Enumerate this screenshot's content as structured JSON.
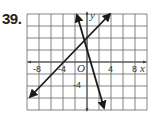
{
  "problem_number": "39.",
  "chart_data": {
    "type": "line",
    "title": "",
    "xlabel": "x",
    "ylabel": "y",
    "origin_label": "O",
    "xlim": [
      -10,
      10
    ],
    "ylim": [
      -8,
      8
    ],
    "grid": true,
    "grid_step": 2,
    "x_tick_labels": [
      "-8",
      "-4",
      "4",
      "8"
    ],
    "y_tick_labels": [
      "-4"
    ],
    "series": [
      {
        "name": "line-rising",
        "points": [
          [
            -9.5,
            -5.8
          ],
          [
            3.8,
            8
          ]
        ],
        "slope_approx": 1,
        "x_intercept_approx": -4,
        "y_intercept_approx": 4
      },
      {
        "name": "line-steep-falling",
        "points": [
          [
            -1.7,
            8
          ],
          [
            2.8,
            -7.7
          ]
        ],
        "slope_approx": -3.5,
        "y_intercept_approx": 2
      }
    ],
    "intersection_approx": [
      -0.5,
      4
    ]
  },
  "colors": {
    "grid": "#555555",
    "line": "#1a1a1a",
    "text": "#333333"
  }
}
